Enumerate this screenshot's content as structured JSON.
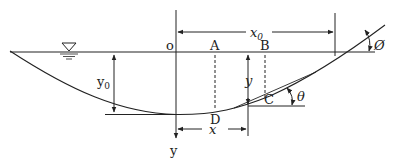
{
  "diagram": {
    "type": "channel cross-section geometry",
    "labels": {
      "origin": "o",
      "point_a": "A",
      "point_b": "B",
      "point_c": "C",
      "point_d": "D",
      "x0": "x",
      "x0_sub": "0",
      "y0": "y",
      "y0_sub": "0",
      "y_depth": "y",
      "x_dist": "x",
      "y_axis": "y",
      "theta": "θ",
      "phi": "Ø"
    },
    "colors": {
      "line": "#222222",
      "background": "#ffffff"
    },
    "symbols": {
      "water_surface": "inverted-triangle-water-level-symbol"
    }
  }
}
